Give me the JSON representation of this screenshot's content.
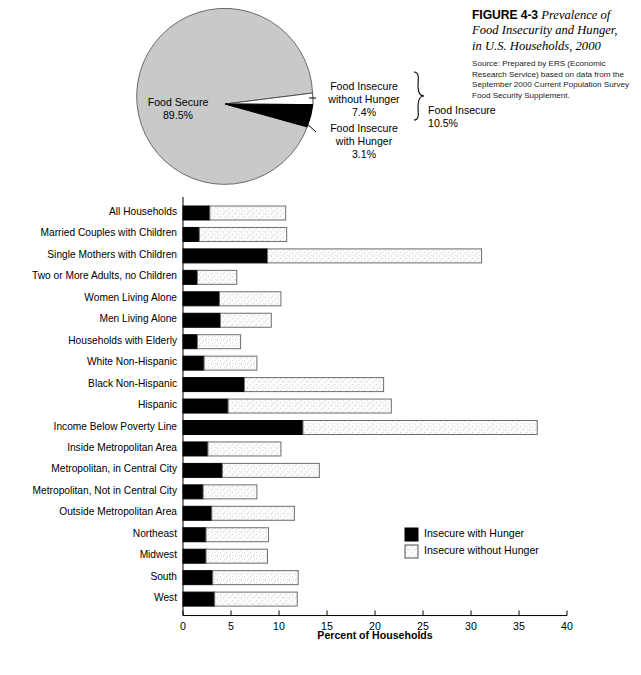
{
  "caption": {
    "figure_number": "FIGURE 4-3",
    "title": "Prevalence of Food Insecurity and Hunger, in U.S. Households, 2000",
    "title_line1": " Prevalence of",
    "title_line2": "Food Insecurity and Hunger,",
    "title_line3": "in U.S. Households, 2000",
    "source": "Source: Prepared by ERS (Economic Research Service) based on data from the September 2000 Current Population Survey Food Security Supplement."
  },
  "colors": {
    "food_secure_fill": "#c9c9c9",
    "insecure_with_hunger_fill": "#000000",
    "insecure_without_hunger_fill": "#ffffff",
    "stroke": "#4d4d4d",
    "speckle": "#8c8c8c"
  },
  "chart_data": [
    {
      "type": "pie",
      "title": "Prevalence of Food Insecurity and Hunger, in U.S. Households, 2000",
      "labels": [
        "Food Secure",
        "Food Insecure without Hunger",
        "Food Insecure with Hunger"
      ],
      "values": [
        89.5,
        7.4,
        3.1
      ],
      "value_labels": [
        "89.5%",
        "7.4%",
        "3.1%"
      ],
      "slices": [
        {
          "name": "Food Secure",
          "label_line1": "Food Secure",
          "label_line2": "89.5%",
          "value": 89.5,
          "color": "#c9c9c9"
        },
        {
          "name": "Food Insecure without Hunger",
          "label_line1": "Food Insecure",
          "label_line2": "without Hunger",
          "label_line3": "7.4%",
          "value": 7.4,
          "color": "#ffffff"
        },
        {
          "name": "Food Insecure with Hunger",
          "label_line1": "Food Insecure",
          "label_line2": "with Hunger",
          "label_line3": "3.1%",
          "value": 3.1,
          "color": "#000000"
        }
      ],
      "bracket_label_line1": "Food Insecure",
      "bracket_label_line2": "10.5%",
      "bracket_total": 10.5
    },
    {
      "type": "bar",
      "orientation": "horizontal",
      "stacked": true,
      "title": "",
      "xlabel": "Percent of Households",
      "ylabel": "",
      "xlim": [
        0,
        40
      ],
      "xticks": [
        0,
        5,
        10,
        15,
        20,
        25,
        30,
        35,
        40
      ],
      "xtick_labels": [
        "0",
        "5",
        "10",
        "15",
        "20",
        "25",
        "30",
        "35",
        "40"
      ],
      "grid": false,
      "legend_position": "center-right",
      "legend": [
        "Insecure with Hunger",
        "Insecure without Hunger"
      ],
      "categories": [
        "All Households",
        "Married Couples with Children",
        "Single Mothers with Children",
        "Two or More Adults, no Children",
        "Women Living Alone",
        "Men Living Alone",
        "Households with Elderly",
        "White Non-Hispanic",
        "Black Non-Hispanic",
        "Hispanic",
        "Income Below Poverty Line",
        "Inside Metropolitan Area",
        "Metropolitan, in Central City",
        "Metropolitan, Not in Central City",
        "Outside Metropolitan Area",
        "Northeast",
        "Midwest",
        "South",
        "West"
      ],
      "series": [
        {
          "name": "Insecure with Hunger",
          "color": "#000000",
          "values": [
            2.8,
            1.7,
            8.8,
            1.5,
            3.8,
            3.9,
            1.5,
            2.2,
            6.4,
            4.7,
            12.5,
            2.6,
            4.1,
            2.1,
            3.0,
            2.4,
            2.4,
            3.1,
            3.3
          ]
        },
        {
          "name": "Insecure without Hunger",
          "color": "#ffffff",
          "values": [
            7.9,
            9.1,
            22.3,
            4.1,
            6.4,
            5.3,
            4.5,
            5.5,
            14.5,
            17.0,
            24.4,
            7.6,
            10.1,
            5.6,
            8.6,
            6.5,
            6.4,
            8.9,
            8.6
          ]
        }
      ],
      "totals": [
        10.7,
        10.8,
        31.1,
        5.6,
        10.2,
        9.2,
        6.0,
        7.7,
        20.9,
        21.7,
        36.9,
        10.2,
        14.2,
        7.7,
        11.6,
        8.9,
        8.8,
        12.0,
        11.9
      ]
    }
  ]
}
